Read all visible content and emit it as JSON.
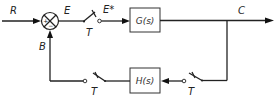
{
  "diagram": {
    "type": "sampled-data feedback control block diagram",
    "signals": {
      "input": "R",
      "error": "E",
      "sampled_error": "E*",
      "output": "C",
      "feedback": "B"
    },
    "summing_junction": {
      "plus_sign": "+",
      "minus_sign": "−"
    },
    "blocks": {
      "forward": "G(s)",
      "feedback": "H(s)"
    },
    "samplers": {
      "forward_label": "T",
      "feedback_output_label": "T",
      "feedback_input_label": "T"
    },
    "colors": {
      "line": "#222222",
      "background": "#ffffff"
    }
  }
}
